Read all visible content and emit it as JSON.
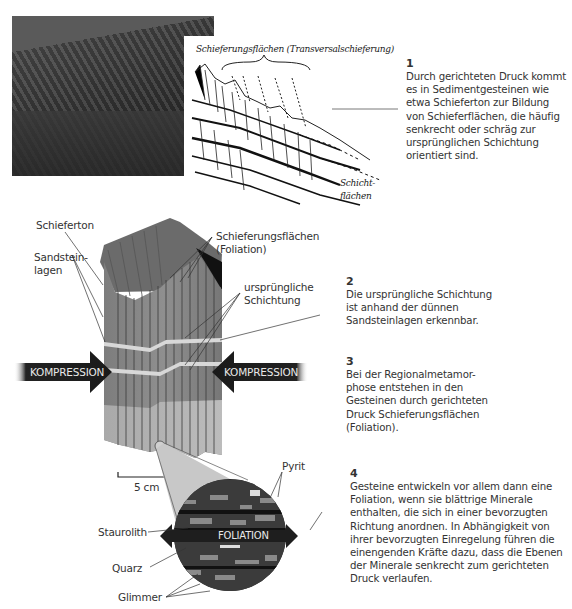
{
  "photo": {
    "alt": "rock-outcrop-photo"
  },
  "sketch": {
    "title": "Schieferungsflächen (Transversalschieferung)",
    "label_bottom_line1": "Schicht-",
    "label_bottom_line2": "flächen"
  },
  "notes": [
    {
      "num": "1",
      "text": "Durch gerichteten Druck kommt es in Sedimentgesteinen wie etwa Schieferton zur Bildung von Schieferflächen, die häufig senkrecht oder schräg zur ursprünglichen Schichtung orientiert sind."
    },
    {
      "num": "2",
      "text": "Die ursprüngliche Schichtung ist anhand der dünnen Sandsteinlagen erkennbar."
    },
    {
      "num": "3",
      "text": "Bei der Regionalmetamor-phose entstehen in den Gesteinen durch gerichteten Druck Schieferungsflächen (Foliation)."
    },
    {
      "num": "4",
      "text": "Gesteine entwickeln vor allem dann eine Foliation, wenn sie blättrige Minerale enthalten, die sich in einer bevorzugten Richtung anordnen. In Abhängigkeit von ihrer bevorzugten Einregelung führen die einengenden Kräfte dazu, dass die Ebenen der Minerale senkrecht zum gerichteten Druck verlaufen."
    }
  ],
  "block_labels": {
    "schieferton": "Schieferton",
    "sandstein_1": "Sandstein-",
    "sandstein_2": "lagen",
    "foliation_1": "Schieferungsflächen",
    "foliation_2": "(Foliation)",
    "schichtung_1": "ursprüngliche",
    "schichtung_2": "Schichtung",
    "compression_left": "KOMPRESSION",
    "compression_right": "KOMPRESSION",
    "scale": "5 cm"
  },
  "micro_labels": {
    "pyrit": "Pyrit",
    "staurolith": "Staurolith",
    "quarz": "Quarz",
    "glimmer": "Glimmer",
    "foliation_arrow": "FOLIATION"
  }
}
